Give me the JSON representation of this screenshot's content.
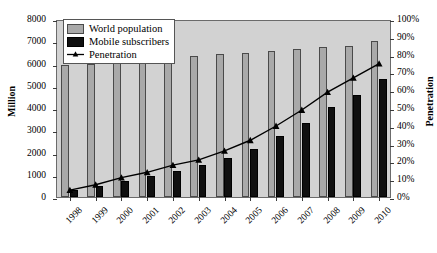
{
  "chart_data": {
    "type": "bar",
    "title": "",
    "xlabel": "",
    "ylabel": "Million",
    "y2label": "Penetration",
    "categories": [
      "1998",
      "1999",
      "2000",
      "2001",
      "2002",
      "2003",
      "2004",
      "2005",
      "2006",
      "2007",
      "2008",
      "2009",
      "2010"
    ],
    "ylim": [
      0,
      8000
    ],
    "yticks": [
      0,
      1000,
      2000,
      3000,
      4000,
      5000,
      6000,
      7000,
      8000
    ],
    "ytick_labels": [
      "0",
      "1000",
      "2000",
      "3000",
      "4000",
      "5000",
      "6000",
      "7000",
      "8000"
    ],
    "y2lim": [
      0,
      100
    ],
    "y2ticks": [
      0,
      10,
      20,
      30,
      40,
      50,
      60,
      70,
      80,
      90,
      100
    ],
    "y2tick_labels": [
      "0%",
      "10%",
      "20%",
      "30%",
      "40%",
      "50%",
      "60%",
      "70%",
      "80%",
      "90%",
      "100%"
    ],
    "grid": false,
    "legend_position": "upper-left",
    "series": [
      {
        "name": "World population",
        "type": "bar",
        "axis": "left",
        "unit": "Million",
        "color": "#a9a9a9",
        "values": [
          5920,
          6000,
          6080,
          6160,
          6240,
          6330,
          6410,
          6490,
          6570,
          6650,
          6720,
          6800,
          6990
        ]
      },
      {
        "name": "Mobile subscribers",
        "type": "bar",
        "axis": "left",
        "unit": "Million",
        "color": "#101010",
        "values": [
          320,
          490,
          740,
          960,
          1160,
          1420,
          1760,
          2170,
          2750,
          3330,
          4040,
          4600,
          5300
        ]
      },
      {
        "name": "Penetration",
        "type": "line",
        "axis": "right",
        "unit": "%",
        "color": "#000000",
        "marker": "triangle",
        "values": [
          5,
          8,
          12,
          15,
          19,
          22,
          27,
          33,
          41,
          50,
          60,
          68,
          76
        ]
      }
    ]
  },
  "legend": {
    "items": [
      {
        "label": "World population",
        "key": "swatch-gray"
      },
      {
        "label": "Mobile subscribers",
        "key": "swatch-black"
      },
      {
        "label": "Penetration",
        "key": "line-marker"
      }
    ]
  },
  "colors": {
    "plot_background": "#d2d2d2",
    "plot_border": "#6b6b6b",
    "population_bar": "#a9a9a9",
    "mobile_bar": "#101010",
    "penetration_line": "#000000",
    "page_background": "#ffffff"
  }
}
